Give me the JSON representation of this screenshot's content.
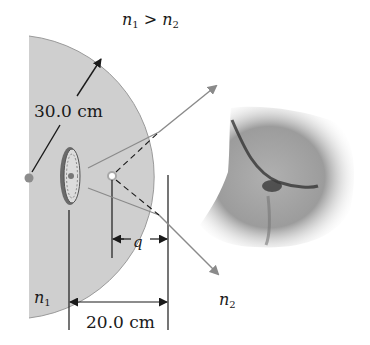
{
  "figure": {
    "condition": {
      "n_a": "n",
      "sub_a": "1",
      "op": " > ",
      "n_b": "n",
      "sub_b": "2"
    },
    "radius_label": "30.0 cm",
    "distance_label": "20.0 cm",
    "image_distance_label": "q",
    "medium_inside": {
      "symbol": "n",
      "sub": "1"
    },
    "medium_outside": {
      "symbol": "n",
      "sub": "2"
    }
  },
  "colors": {
    "sphere_fill": "#cfcfcf",
    "sphere_edge": "#9a9a9a",
    "ray": "#8a8a8a",
    "line": "#1a1a1a",
    "dot": "#8c8c8c",
    "image_ring": "#a8a8a8"
  }
}
